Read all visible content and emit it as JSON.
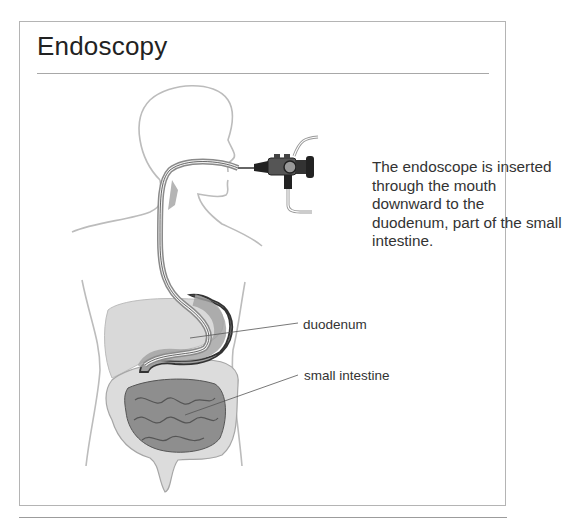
{
  "figure": {
    "title": "Endoscopy",
    "caption": "The endoscope is inserted through the mouth downward to the duodenum, part of the small intestine.",
    "labels": {
      "duodenum": "duodenum",
      "small_intestine": "small intestine"
    },
    "illustration": {
      "subject": "human torso profile with endoscope",
      "parts": [
        "head",
        "esophagus",
        "endoscope",
        "liver",
        "stomach",
        "duodenum",
        "small intestine",
        "large intestine"
      ]
    },
    "colors": {
      "outline": "#b8b8b8",
      "organ_light": "#d4d4d4",
      "organ_mid": "#a8a8a8",
      "organ_dark": "#7a7a7a",
      "scope": "#3a3a3a",
      "text": "#333333"
    }
  }
}
